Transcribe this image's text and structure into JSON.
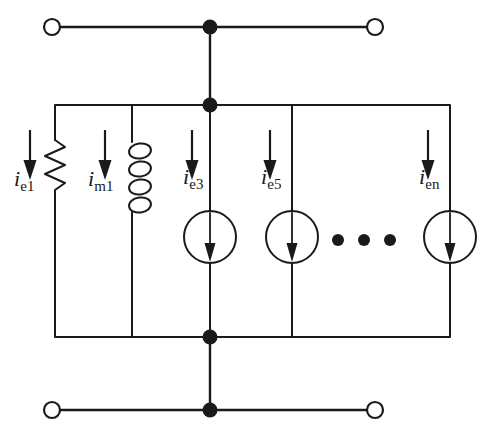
{
  "figure": {
    "kind": "circuit-schematic",
    "background_color": "#ffffff",
    "line_color": "#1a1a1a",
    "node_fill": "#1a1a1a",
    "terminal_fill": "#ffffff"
  },
  "labels": [
    {
      "name": "i-e1",
      "symbol": "i",
      "subscript": "e1",
      "x": 14,
      "y": 168
    },
    {
      "name": "i-m1",
      "symbol": "i",
      "subscript": "m1",
      "x": 88,
      "y": 168
    },
    {
      "name": "i-e3",
      "symbol": "i",
      "subscript": "e3",
      "x": 184,
      "y": 166
    },
    {
      "name": "i-e5",
      "symbol": "i",
      "subscript": "e5",
      "x": 261,
      "y": 166
    },
    {
      "name": "i-en",
      "symbol": "i",
      "subscript": "en",
      "x": 419,
      "y": 166
    }
  ],
  "components": {
    "resistor": {
      "name": "resistor-re1",
      "x": 55,
      "y_top": 140,
      "y_bottom": 196
    },
    "inductor": {
      "name": "inductor-lm1",
      "x": 132,
      "y_top": 140,
      "y_bottom": 212
    },
    "sources": [
      {
        "name": "current-source-ie3",
        "cx": 210,
        "cy": 237,
        "r": 26
      },
      {
        "name": "current-source-ie5",
        "cx": 292,
        "cy": 237,
        "r": 26
      },
      {
        "name": "current-source-ien",
        "cx": 450,
        "cy": 237,
        "r": 26
      }
    ],
    "ellipsis_dots": [
      {
        "cx": 338,
        "cy": 240,
        "r": 6
      },
      {
        "cx": 364,
        "cy": 240,
        "r": 6
      },
      {
        "cx": 390,
        "cy": 240,
        "r": 6
      }
    ]
  },
  "terminals": [
    {
      "name": "terminal-top-left",
      "cx": 52,
      "cy": 27,
      "r": 8
    },
    {
      "name": "terminal-top-right",
      "cx": 375,
      "cy": 27,
      "r": 8
    },
    {
      "name": "terminal-bottom-left",
      "cx": 52,
      "cy": 410,
      "r": 8
    },
    {
      "name": "terminal-bottom-right",
      "cx": 375,
      "cy": 410,
      "r": 8
    }
  ],
  "junctions": [
    {
      "name": "junction-top-port",
      "cx": 210,
      "cy": 27,
      "r": 7
    },
    {
      "name": "junction-top-rail",
      "cx": 210,
      "cy": 105,
      "r": 7
    },
    {
      "name": "junction-bottom-rail",
      "cx": 210,
      "cy": 337,
      "r": 7
    },
    {
      "name": "junction-bottom-port",
      "cx": 210,
      "cy": 410,
      "r": 7
    }
  ],
  "rails": {
    "top_port_wire": {
      "x1": 52,
      "x2": 375,
      "y": 27
    },
    "bottom_port_wire": {
      "x1": 52,
      "x2": 375,
      "y": 410
    },
    "network_top": {
      "x1": 55,
      "x2": 450,
      "y": 105
    },
    "network_bottom": {
      "x1": 55,
      "x2": 450,
      "y": 337
    },
    "center_stem_top": {
      "x": 210,
      "y1": 27,
      "y2": 105
    },
    "center_stem_bottom": {
      "x": 210,
      "y1": 337,
      "y2": 410
    }
  },
  "current_arrows": [
    {
      "name": "arrow-ie1",
      "x": 30,
      "y1": 130,
      "y2": 178
    },
    {
      "name": "arrow-im1",
      "x": 105,
      "y1": 130,
      "y2": 178
    },
    {
      "name": "arrow-ie3",
      "x": 210,
      "y1": 130,
      "y2": 178
    },
    {
      "name": "arrow-ie5",
      "x": 268,
      "y1": 130,
      "y2": 178
    },
    {
      "name": "arrow-ien",
      "x": 427,
      "y1": 130,
      "y2": 178
    }
  ]
}
